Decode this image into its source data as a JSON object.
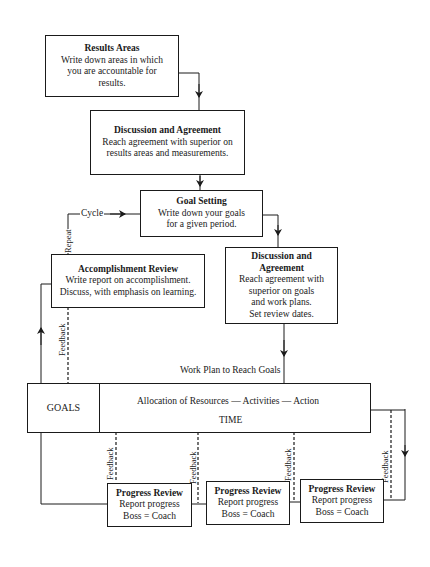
{
  "results_areas": {
    "title": "Results Areas",
    "lines": [
      "Write down areas in which",
      "you are accountable for",
      "results."
    ]
  },
  "discussion_agreement_1": {
    "title": "Discussion and Agreement",
    "lines": [
      "Reach agreement with superior on",
      "results areas and measurements."
    ]
  },
  "goal_setting": {
    "title": "Goal Setting",
    "lines": [
      "Write down your goals",
      "for a given period."
    ]
  },
  "accomplishment_review": {
    "title": "Accomplishment Review",
    "lines": [
      "Write report on accomplishment.",
      "Discuss, with emphasis on learning."
    ]
  },
  "discussion_agreement_2": {
    "title_lines": [
      "Discussion and",
      "Agreement"
    ],
    "lines": [
      "Reach agreement with",
      "superior on goals",
      "and work plans.",
      "Set review dates."
    ]
  },
  "labels": {
    "cycle": "Cycle",
    "repeat": "Repeat",
    "feedback": "Feedback",
    "work_plan": "Work Plan to Reach Goals",
    "allocation": "Allocation of Resources — Activities — Action",
    "time": "TIME"
  },
  "goals_box": {
    "label": "GOALS"
  },
  "progress_reviews": [
    {
      "title": "Progress Review",
      "lines": [
        "Report progress",
        "Boss = Coach"
      ]
    },
    {
      "title": "Progress Review",
      "lines": [
        "Report progress",
        "Boss = Coach"
      ]
    },
    {
      "title": "Progress Review",
      "lines": [
        "Report progress",
        "Boss = Coach"
      ]
    }
  ]
}
